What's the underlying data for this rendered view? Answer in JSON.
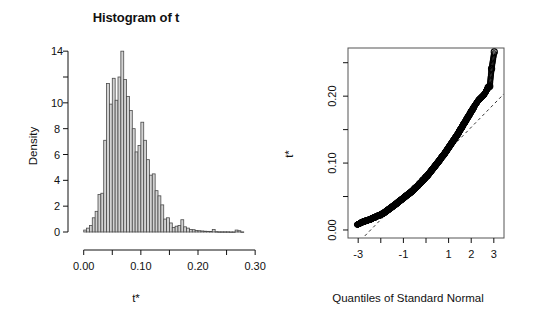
{
  "figure": {
    "width": 544,
    "height": 324,
    "background": "#ffffff",
    "foreground": "#111111"
  },
  "panels": [
    {
      "name": "histogram",
      "title": "Histogram of t",
      "xlabel": "t*",
      "ylabel": "Density"
    },
    {
      "name": "qq-plot",
      "title": "",
      "xlabel": "Quantiles of Standard Normal",
      "ylabel": "t*"
    }
  ],
  "chart_data": [
    {
      "type": "bar",
      "name": "histogram-of-t",
      "title": "Histogram of t",
      "xlabel": "t*",
      "ylabel": "Density",
      "xlim": [
        -0.01,
        0.305
      ],
      "ylim": [
        0,
        14.4
      ],
      "xticks": [
        0.0,
        0.05,
        0.1,
        0.15,
        0.2,
        0.25,
        0.3
      ],
      "xtick_labels": [
        "0.00",
        "",
        "0.10",
        "",
        "0.20",
        "",
        "0.30"
      ],
      "yticks": [
        0,
        2,
        4,
        6,
        8,
        10,
        12,
        14
      ],
      "ytick_labels": [
        "0",
        "2",
        "4",
        "6",
        "8",
        "10",
        "",
        "14"
      ],
      "grid": false,
      "legend": null,
      "bar_fill": "#d2d2d2",
      "bar_border": "#4a4a4a",
      "bin_width": 0.005,
      "bin_starts": [
        0.0,
        0.005,
        0.01,
        0.015,
        0.02,
        0.025,
        0.03,
        0.035,
        0.04,
        0.045,
        0.05,
        0.055,
        0.06,
        0.065,
        0.07,
        0.075,
        0.08,
        0.085,
        0.09,
        0.095,
        0.1,
        0.105,
        0.11,
        0.115,
        0.12,
        0.125,
        0.13,
        0.135,
        0.14,
        0.145,
        0.15,
        0.155,
        0.16,
        0.165,
        0.17,
        0.175,
        0.18,
        0.185,
        0.19,
        0.195,
        0.2,
        0.205,
        0.21,
        0.215,
        0.22,
        0.225,
        0.23,
        0.235,
        0.24,
        0.245,
        0.25,
        0.255,
        0.26,
        0.265,
        0.27,
        0.275,
        0.28,
        0.285,
        0.29,
        0.295
      ],
      "values": [
        0.15,
        0.3,
        0.5,
        1.1,
        1.6,
        2.9,
        3.0,
        7.1,
        11.5,
        9.9,
        11.9,
        10.2,
        12.0,
        14.0,
        11.8,
        10.5,
        9.4,
        8.0,
        6.2,
        6.7,
        8.5,
        7.1,
        5.6,
        4.4,
        4.5,
        3.2,
        2.8,
        2.1,
        1.0,
        1.1,
        0.7,
        0.35,
        0.45,
        0.5,
        0.95,
        0.4,
        0.3,
        0.2,
        0.18,
        0.12,
        0.1,
        0.08,
        0.06,
        0.05,
        0.04,
        0.2,
        0.03,
        0.02,
        0.02,
        0.02,
        0.02,
        0.01,
        0.01,
        0.15,
        0.1,
        0.01,
        0.0,
        0.0,
        0.0,
        0.0
      ]
    },
    {
      "type": "scatter",
      "name": "normal-qq-plot",
      "title": "",
      "xlabel": "Quantiles of Standard Normal",
      "ylabel": "t*",
      "xlim": [
        -3.45,
        3.45
      ],
      "ylim": [
        -0.012,
        0.272
      ],
      "xticks": [
        -3,
        -2,
        -1,
        0,
        1,
        2,
        3
      ],
      "xtick_labels": [
        "-3",
        "",
        "-1",
        "",
        "1",
        "2",
        "3"
      ],
      "yticks": [
        0.0,
        0.05,
        0.1,
        0.15,
        0.2,
        0.25
      ],
      "ytick_labels": [
        "0.00",
        "",
        "0.10",
        "",
        "0.20",
        ""
      ],
      "grid": false,
      "legend": null,
      "box_frame": true,
      "point_marker": "open-circle",
      "point_color": "#000000",
      "reference_line": {
        "style": "dashed",
        "color": "#333333",
        "slope": 0.0345,
        "intercept": 0.0845
      },
      "x": [
        -3.05,
        -2.95,
        -2.88,
        -2.8,
        -2.72,
        -2.64,
        -2.55,
        -2.45,
        -2.35,
        -2.25,
        -2.15,
        -2.05,
        -1.95,
        -1.88,
        -1.8,
        -1.72,
        -1.64,
        -1.56,
        -1.48,
        -1.4,
        -1.32,
        -1.25,
        -1.18,
        -1.1,
        -1.02,
        -0.95,
        -0.88,
        -0.8,
        -0.72,
        -0.65,
        -0.58,
        -0.5,
        -0.43,
        -0.36,
        -0.29,
        -0.22,
        -0.15,
        -0.08,
        -0.01,
        0.06,
        0.13,
        0.2,
        0.27,
        0.34,
        0.41,
        0.48,
        0.55,
        0.62,
        0.7,
        0.78,
        0.86,
        0.94,
        1.02,
        1.1,
        1.18,
        1.26,
        1.34,
        1.42,
        1.5,
        1.58,
        1.66,
        1.74,
        1.82,
        1.9,
        1.98,
        2.06,
        2.14,
        2.2,
        2.26,
        2.32,
        2.38,
        2.44,
        2.5,
        2.56,
        2.62,
        2.68,
        2.75,
        2.82,
        2.9,
        3.02
      ],
      "y": [
        0.008,
        0.009,
        0.011,
        0.012,
        0.013,
        0.014,
        0.015,
        0.016,
        0.018,
        0.019,
        0.021,
        0.022,
        0.024,
        0.025,
        0.027,
        0.029,
        0.031,
        0.033,
        0.035,
        0.037,
        0.039,
        0.041,
        0.043,
        0.045,
        0.047,
        0.049,
        0.051,
        0.053,
        0.055,
        0.057,
        0.059,
        0.062,
        0.064,
        0.066,
        0.069,
        0.071,
        0.074,
        0.076,
        0.079,
        0.081,
        0.084,
        0.087,
        0.09,
        0.093,
        0.096,
        0.099,
        0.102,
        0.105,
        0.109,
        0.112,
        0.116,
        0.12,
        0.124,
        0.128,
        0.132,
        0.136,
        0.14,
        0.144,
        0.149,
        0.153,
        0.158,
        0.162,
        0.167,
        0.171,
        0.176,
        0.18,
        0.185,
        0.188,
        0.191,
        0.194,
        0.196,
        0.198,
        0.2,
        0.202,
        0.205,
        0.209,
        0.213,
        0.215,
        0.241,
        0.266
      ]
    }
  ]
}
